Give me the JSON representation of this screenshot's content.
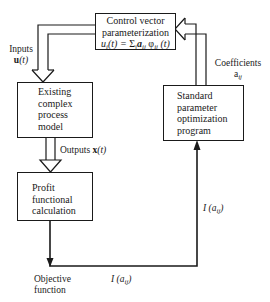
{
  "diagram": {
    "type": "control-optimization-flowchart",
    "nodes": {
      "control": {
        "lines": [
          "Control vector",
          "parameterization"
        ],
        "formula": {
          "lhs": "u",
          "lhs_sub": "i",
          "lhs_arg": "(t) = ",
          "sigma": "Σ",
          "sigma_sub": "j",
          "a": "a",
          "a_sub": "ij",
          "phi": "φ",
          "phi_sub": "ij",
          "phi_arg": "(t)"
        }
      },
      "process": {
        "lines": [
          "Existing",
          "complex",
          "process",
          "model"
        ]
      },
      "profit": {
        "lines": [
          "Profit",
          "functional",
          "calculation"
        ]
      },
      "optimizer": {
        "lines": [
          "Standard",
          "parameter",
          "optimization",
          "program"
        ]
      }
    },
    "labels": {
      "inputs": {
        "word": "Inputs",
        "symbol": "u",
        "arg": "(t)"
      },
      "outputs": {
        "word": "Outputs",
        "symbol": "x",
        "arg": "(t)"
      },
      "coefficients": {
        "word": "Coefficients",
        "symbol": "a",
        "sub": "ij"
      },
      "objective": {
        "line1": "Objective",
        "line2": "function"
      },
      "i_bottom": {
        "prefix": "I (",
        "symbol": "a",
        "sub": "ij",
        "suffix": ")"
      },
      "i_right": {
        "prefix": "I (",
        "symbol": "a",
        "sub": "ij",
        "suffix": ")"
      }
    },
    "edges": [
      {
        "from": "optimizer",
        "to": "control",
        "style": "hollow-double",
        "label": "Coefficients a_ij"
      },
      {
        "from": "control",
        "to": "process",
        "style": "hollow-double",
        "label": "Inputs u(t)"
      },
      {
        "from": "process",
        "to": "profit",
        "style": "hollow-double",
        "label": "Outputs x(t)"
      },
      {
        "from": "profit",
        "to": "objective",
        "style": "solid",
        "label": "Objective function"
      },
      {
        "from": "objective",
        "to": "optimizer",
        "style": "solid",
        "label": "I(a_ij)"
      }
    ],
    "colors": {
      "stroke": "#1a1a1a",
      "background": "#ffffff"
    }
  }
}
